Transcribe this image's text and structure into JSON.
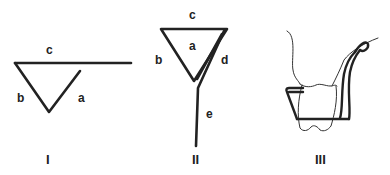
{
  "figures": [
    {
      "id": "I",
      "caption": "I",
      "labels": {
        "a": "a",
        "b": "b",
        "c": "c"
      }
    },
    {
      "id": "II",
      "caption": "II",
      "labels": {
        "a": "a",
        "b": "b",
        "c": "c",
        "d": "d",
        "e": "e"
      }
    },
    {
      "id": "III",
      "caption": "III"
    }
  ],
  "colors": {
    "stroke": "#222222",
    "background": "#ffffff"
  }
}
